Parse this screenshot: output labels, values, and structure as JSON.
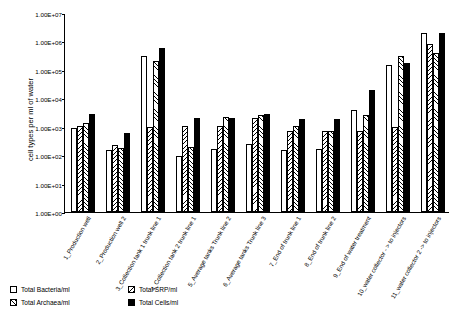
{
  "chart_data": {
    "type": "bar",
    "title": "",
    "xlabel": "",
    "ylabel": "cell types per ml of water",
    "log_scale": true,
    "ylim": [
      1,
      10000000
    ],
    "ytick_labels": [
      "1.00E+00",
      "1.00E+01",
      "1.00E+02",
      "1.00E+03",
      "1.00E+04",
      "1.00E+05",
      "1.00E+06",
      "1.00E+07"
    ],
    "ytick_values": [
      1,
      10,
      100,
      1000,
      10000,
      100000,
      1000000,
      10000000
    ],
    "grid": false,
    "legend_position": "bottom-left",
    "categories": [
      "1_Production well",
      "2_Production well 2",
      "3_Collection tank 1 trunk line 1",
      "4_Collection tank 2 trunk line 1",
      "5_Average tanks Trunk line 2",
      "6_Average tanks Trunk line 3",
      "7_End of trunk line 1",
      "8_End of trunk line 2",
      "9_End of water treatment",
      "10_water collector - > to injectors",
      "11_water collector 2 -> to injectors"
    ],
    "series": [
      {
        "name": "Total Bacteria/ml",
        "values": [
          900,
          150,
          300000,
          90,
          170,
          250,
          150,
          170,
          4000,
          150000,
          2000000
        ]
      },
      {
        "name": "Total SRP/ml",
        "values": [
          1100,
          220,
          1000,
          1100,
          1100,
          2000,
          700,
          700,
          700,
          1000,
          800000
        ]
      },
      {
        "name": "Total Archaea/ml",
        "values": [
          1400,
          180,
          200000,
          200,
          2200,
          2500,
          1100,
          700,
          2500,
          300000,
          400000
        ]
      },
      {
        "name": "Total Cells/ml",
        "values": [
          2700,
          600,
          600000,
          2000,
          2000,
          2700,
          1800,
          1900,
          20000,
          170000,
          2000000
        ]
      }
    ],
    "series_styles": [
      "white",
      "diagonal-hatch-right",
      "diagonal-hatch-left",
      "solid-black"
    ]
  },
  "legend": {
    "items": [
      {
        "label": "Total Bacteria/ml",
        "style": "white"
      },
      {
        "label": "Total SRP/ml",
        "style": "diagonal-hatch-right"
      },
      {
        "label": "Total Archaea/ml",
        "style": "diagonal-hatch-left"
      },
      {
        "label": "Total Cells/ml",
        "style": "solid-black"
      }
    ]
  }
}
